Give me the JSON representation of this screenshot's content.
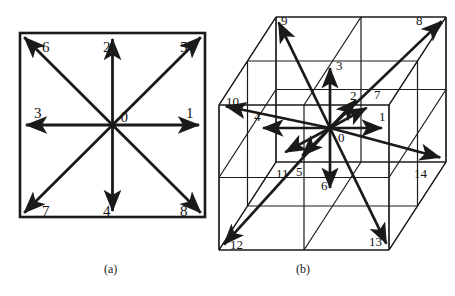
{
  "figure": {
    "background_color": "#ffffff",
    "line_color": "#1a1a1a",
    "label_color": "#141414"
  },
  "panel_a": {
    "caption": "(a)",
    "model": "D2Q9",
    "frame": {
      "x": 20,
      "y": 33,
      "width": 185,
      "height": 184
    },
    "center": {
      "x": 112.5,
      "y": 125
    },
    "center_label": "0",
    "vectors": [
      {
        "label": "1",
        "dx": 1,
        "dy": 0,
        "label_x": 186,
        "label_y": 118
      },
      {
        "label": "2",
        "dx": 0,
        "dy": -1,
        "label_x": 103,
        "label_y": 52
      },
      {
        "label": "3",
        "dx": -1,
        "dy": 0,
        "label_x": 34,
        "label_y": 118
      },
      {
        "label": "4",
        "dx": 0,
        "dy": 1,
        "label_x": 103,
        "label_y": 216
      },
      {
        "label": "5",
        "dx": 1,
        "dy": -1,
        "label_x": 180,
        "label_y": 52
      },
      {
        "label": "6",
        "dx": -1,
        "dy": -1,
        "label_x": 42,
        "label_y": 52
      },
      {
        "label": "7",
        "dx": -1,
        "dy": 1,
        "label_x": 42,
        "label_y": 216
      },
      {
        "label": "8",
        "dx": 1,
        "dy": 1,
        "label_x": 180,
        "label_y": 216
      }
    ]
  },
  "panel_b": {
    "caption": "(b)",
    "model": "D3Q15",
    "center": {
      "x": 330,
      "y": 128
    },
    "center_label": "0",
    "cube": {
      "front_top_left": {
        "x": 219,
        "y": 105
      },
      "front_top_right": {
        "x": 389,
        "y": 105
      },
      "front_bottom_left": {
        "x": 219,
        "y": 250
      },
      "front_bottom_right": {
        "x": 389,
        "y": 250
      },
      "depth_dx": 57,
      "depth_dy": -88,
      "divisions": 2
    },
    "vectors": [
      {
        "label": "1",
        "tip_x": 388,
        "tip_y": 128,
        "label_x": 379,
        "label_y": 121
      },
      {
        "label": "2",
        "tip_x": 360,
        "tip_y": 96,
        "label_x": 350,
        "label_y": 100
      },
      {
        "label": "3",
        "tip_x": 330,
        "tip_y": 62,
        "label_x": 336,
        "label_y": 70
      },
      {
        "label": "4",
        "tip_x": 257,
        "tip_y": 128,
        "label_x": 254,
        "label_y": 121
      },
      {
        "label": "5",
        "tip_x": 298,
        "tip_y": 160,
        "label_x": 296,
        "label_y": 176
      },
      {
        "label": "6",
        "tip_x": 330,
        "tip_y": 194,
        "label_x": 321,
        "label_y": 190
      },
      {
        "label": "7",
        "tip_x": 372,
        "tip_y": 105,
        "label_x": 374,
        "label_y": 99
      },
      {
        "label": "8",
        "tip_x": 446,
        "tip_y": 17,
        "label_x": 416,
        "label_y": 25
      },
      {
        "label": "9",
        "tip_x": 276,
        "tip_y": 17,
        "label_x": 281,
        "label_y": 25
      },
      {
        "label": "10",
        "tip_x": 220,
        "tip_y": 105,
        "label_x": 226,
        "label_y": 106
      },
      {
        "label": "11",
        "tip_x": 280,
        "tip_y": 155,
        "label_x": 276,
        "label_y": 178
      },
      {
        "label": "12",
        "tip_x": 220,
        "tip_y": 249,
        "label_x": 230,
        "label_y": 249
      },
      {
        "label": "13",
        "tip_x": 389,
        "tip_y": 249,
        "label_x": 369,
        "label_y": 246
      },
      {
        "label": "14",
        "tip_x": 446,
        "tip_y": 159,
        "label_x": 414,
        "label_y": 178
      }
    ]
  }
}
